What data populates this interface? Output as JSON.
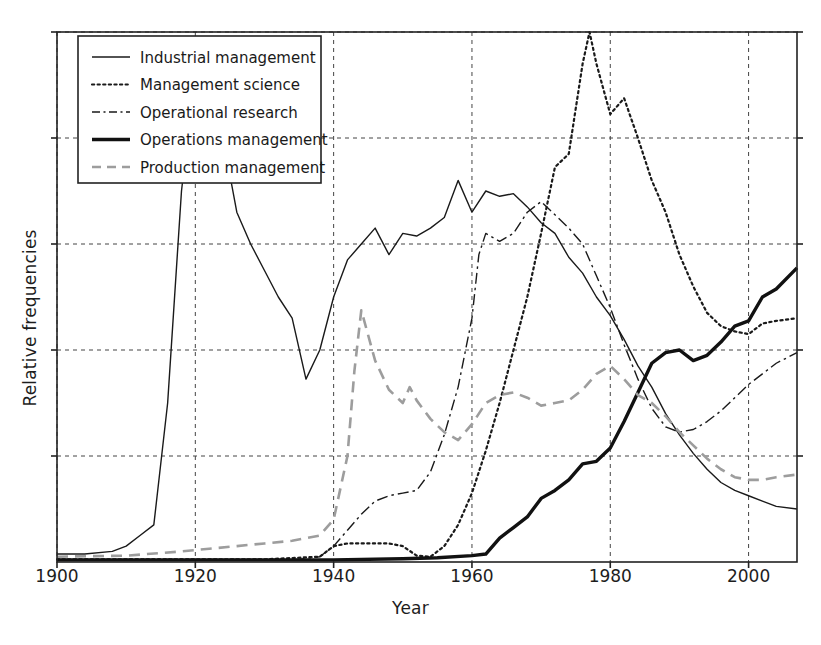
{
  "chart_data": {
    "type": "line",
    "title": "",
    "xlabel": "Year",
    "ylabel": "Relative frequencies",
    "xlim": [
      1900,
      2007
    ],
    "ylim": [
      0,
      1.0
    ],
    "xticks": [
      1900,
      1920,
      1940,
      1960,
      1980,
      2000
    ],
    "xtick_labels": [
      "1900",
      "1920",
      "1940",
      "1960",
      "1980",
      "2000"
    ],
    "yticks": [
      0.2,
      0.4,
      0.6,
      0.8,
      1.0
    ],
    "ytick_labels": [
      "",
      "",
      "",
      "",
      ""
    ],
    "grid": true,
    "legend_position": "upper left",
    "series": [
      {
        "name": "Industrial management",
        "style": "solid",
        "color": "#1a1a1a",
        "width": 1.4,
        "x": [
          1900,
          1904,
          1908,
          1910,
          1912,
          1914,
          1916,
          1918,
          1920,
          1921,
          1922,
          1924,
          1926,
          1928,
          1930,
          1932,
          1934,
          1936,
          1938,
          1940,
          1942,
          1944,
          1946,
          1948,
          1950,
          1952,
          1954,
          1956,
          1958,
          1960,
          1962,
          1964,
          1966,
          1968,
          1970,
          1972,
          1974,
          1976,
          1978,
          1980,
          1982,
          1984,
          1986,
          1988,
          1990,
          1992,
          1994,
          1996,
          1998,
          2000,
          2002,
          2004,
          2007
        ],
        "y": [
          0.015,
          0.015,
          0.02,
          0.03,
          0.05,
          0.07,
          0.3,
          0.7,
          0.93,
          0.97,
          0.95,
          0.8,
          0.66,
          0.6,
          0.55,
          0.5,
          0.46,
          0.345,
          0.4,
          0.5,
          0.57,
          0.6,
          0.63,
          0.58,
          0.62,
          0.615,
          0.63,
          0.65,
          0.72,
          0.66,
          0.7,
          0.69,
          0.695,
          0.67,
          0.64,
          0.62,
          0.575,
          0.545,
          0.5,
          0.465,
          0.42,
          0.37,
          0.33,
          0.28,
          0.24,
          0.205,
          0.175,
          0.15,
          0.135,
          0.125,
          0.115,
          0.105,
          0.1
        ]
      },
      {
        "name": "Management science",
        "style": "dotted",
        "color": "#1a1a1a",
        "width": 2.2,
        "x": [
          1900,
          1930,
          1938,
          1940,
          1942,
          1944,
          1946,
          1948,
          1950,
          1952,
          1954,
          1956,
          1958,
          1960,
          1962,
          1964,
          1966,
          1968,
          1970,
          1972,
          1974,
          1976,
          1977,
          1978,
          1980,
          1982,
          1984,
          1986,
          1988,
          1990,
          1992,
          1994,
          1996,
          1998,
          2000,
          2002,
          2004,
          2007
        ],
        "y": [
          0.005,
          0.005,
          0.01,
          0.03,
          0.035,
          0.035,
          0.035,
          0.035,
          0.03,
          0.012,
          0.01,
          0.03,
          0.07,
          0.13,
          0.21,
          0.3,
          0.4,
          0.5,
          0.62,
          0.745,
          0.77,
          0.94,
          1.0,
          0.94,
          0.845,
          0.875,
          0.8,
          0.72,
          0.66,
          0.58,
          0.52,
          0.47,
          0.445,
          0.435,
          0.43,
          0.45,
          0.455,
          0.46
        ]
      },
      {
        "name": "Operational research",
        "style": "dashdot",
        "color": "#1a1a1a",
        "width": 1.4,
        "x": [
          1900,
          1935,
          1938,
          1940,
          1942,
          1944,
          1946,
          1948,
          1950,
          1952,
          1954,
          1956,
          1958,
          1960,
          1961,
          1962,
          1964,
          1966,
          1968,
          1970,
          1972,
          1974,
          1976,
          1978,
          1980,
          1982,
          1984,
          1986,
          1988,
          1990,
          1992,
          1994,
          1996,
          1998,
          2000,
          2002,
          2004,
          2007
        ],
        "y": [
          0.005,
          0.005,
          0.01,
          0.03,
          0.06,
          0.09,
          0.115,
          0.125,
          0.13,
          0.135,
          0.17,
          0.24,
          0.33,
          0.46,
          0.58,
          0.62,
          0.605,
          0.62,
          0.66,
          0.68,
          0.655,
          0.63,
          0.6,
          0.54,
          0.48,
          0.41,
          0.345,
          0.29,
          0.255,
          0.245,
          0.25,
          0.265,
          0.285,
          0.31,
          0.335,
          0.355,
          0.375,
          0.395
        ]
      },
      {
        "name": "Operations management",
        "style": "solid",
        "color": "#111111",
        "width": 3.4,
        "x": [
          1900,
          1940,
          1950,
          1955,
          1960,
          1962,
          1964,
          1966,
          1968,
          1970,
          1972,
          1974,
          1976,
          1978,
          1980,
          1982,
          1984,
          1986,
          1988,
          1990,
          1992,
          1994,
          1996,
          1998,
          2000,
          2002,
          2004,
          2007
        ],
        "y": [
          0.004,
          0.004,
          0.006,
          0.008,
          0.012,
          0.015,
          0.045,
          0.065,
          0.085,
          0.12,
          0.135,
          0.155,
          0.185,
          0.19,
          0.215,
          0.265,
          0.32,
          0.375,
          0.395,
          0.4,
          0.38,
          0.39,
          0.415,
          0.445,
          0.455,
          0.5,
          0.515,
          0.555
        ]
      },
      {
        "name": "Production management",
        "style": "dashed",
        "color": "#9d9d9d",
        "width": 2.6,
        "x": [
          1900,
          1910,
          1918,
          1922,
          1926,
          1930,
          1934,
          1938,
          1940,
          1942,
          1943,
          1944,
          1946,
          1948,
          1950,
          1951,
          1952,
          1954,
          1956,
          1958,
          1960,
          1962,
          1964,
          1966,
          1968,
          1970,
          1972,
          1974,
          1976,
          1978,
          1980,
          1982,
          1984,
          1986,
          1988,
          1990,
          1992,
          1994,
          1996,
          1998,
          2000,
          2002,
          2004,
          2007
        ],
        "y": [
          0.01,
          0.012,
          0.02,
          0.025,
          0.03,
          0.035,
          0.04,
          0.05,
          0.08,
          0.2,
          0.36,
          0.475,
          0.38,
          0.325,
          0.3,
          0.33,
          0.305,
          0.27,
          0.245,
          0.23,
          0.26,
          0.3,
          0.315,
          0.32,
          0.31,
          0.295,
          0.3,
          0.305,
          0.325,
          0.355,
          0.37,
          0.345,
          0.315,
          0.3,
          0.275,
          0.245,
          0.22,
          0.195,
          0.175,
          0.16,
          0.155,
          0.155,
          0.16,
          0.165
        ]
      }
    ]
  },
  "legend": {
    "items": [
      {
        "label": "Industrial management",
        "style": "solid"
      },
      {
        "label": "Management science",
        "style": "dotted"
      },
      {
        "label": "Operational research",
        "style": "dashdot"
      },
      {
        "label": "Operations management",
        "style": "thick-solid"
      },
      {
        "label": "Production management",
        "style": "gray-dashed"
      }
    ]
  },
  "axes": {
    "x_title": "Year",
    "y_title": "Relative frequencies"
  }
}
